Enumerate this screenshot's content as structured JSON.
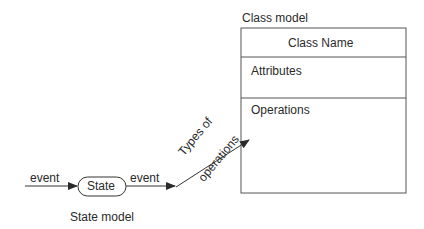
{
  "class_model": {
    "title": "Class model",
    "class_name": "Class Name",
    "attributes": "Attributes",
    "operations": "Operations"
  },
  "state_model": {
    "title": "State model",
    "state_label": "State",
    "event_in": "event",
    "event_out": "event"
  },
  "connector": {
    "label_line1": "Types of",
    "label_line2": "operations"
  },
  "colors": {
    "stroke": "#555555",
    "text": "#2a2a2a",
    "background": "#ffffff"
  }
}
